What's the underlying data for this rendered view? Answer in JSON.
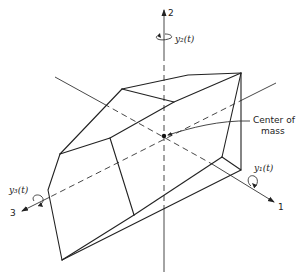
{
  "diagram": {
    "type": "rigid-body-axes",
    "axes": [
      {
        "id": "1",
        "label": "1",
        "rotation_label": "y₁(t)"
      },
      {
        "id": "2",
        "label": "2",
        "rotation_label": "y₂(t)"
      },
      {
        "id": "3",
        "label": "3",
        "rotation_label": "y₃(t)"
      }
    ],
    "annotation": {
      "line1": "Center of",
      "line2": "mass"
    }
  }
}
